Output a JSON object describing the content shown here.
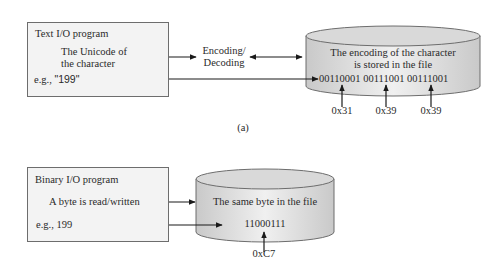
{
  "panel_a": {
    "program_box": {
      "title": "Text I/O program",
      "line1": "The Unicode of",
      "line2": "the character",
      "example_prefix": "e.g., ",
      "example_value": "\"199\""
    },
    "middle_label_line1": "Encoding/",
    "middle_label_line2": "Decoding",
    "file": {
      "line1": "The encoding of the character",
      "line2": "is stored in the file",
      "bits": "00110001 00111001 00111001"
    },
    "hex_labels": [
      "0x31",
      "0x39",
      "0x39"
    ],
    "caption": "(a)"
  },
  "panel_b": {
    "program_box": {
      "title": "Binary I/O program",
      "line1": "A byte is read/written",
      "example": "e.g., 199"
    },
    "file": {
      "line1": "The same byte in the file",
      "bits": "11000111"
    },
    "hex_label": "0xC7"
  },
  "colors": {
    "box_fill": "#f3f3f3",
    "box_border": "#6d6d6d",
    "cylinder_fill": "#d6d6d6",
    "cylinder_highlight": "#f2f2f2",
    "arrow": "#1a1a1a"
  }
}
